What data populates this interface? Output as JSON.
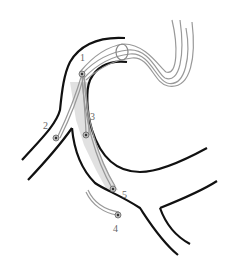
{
  "diagram": {
    "type": "anatomical-catheter-diagram",
    "colors": {
      "vessel_outline": "#111111",
      "catheter": "#999999",
      "shaded_region": "#dcdcdc",
      "label": "#666666",
      "background": "#ffffff"
    },
    "labels": [
      {
        "id": "1",
        "text": "1",
        "x": 80,
        "y": 53
      },
      {
        "id": "2",
        "text": "2",
        "x": 43,
        "y": 121
      },
      {
        "id": "3",
        "text": "3",
        "x": 90,
        "y": 112
      },
      {
        "id": "4",
        "text": "4",
        "x": 113,
        "y": 224
      },
      {
        "id": "5",
        "text": "5",
        "x": 122,
        "y": 190
      }
    ]
  }
}
